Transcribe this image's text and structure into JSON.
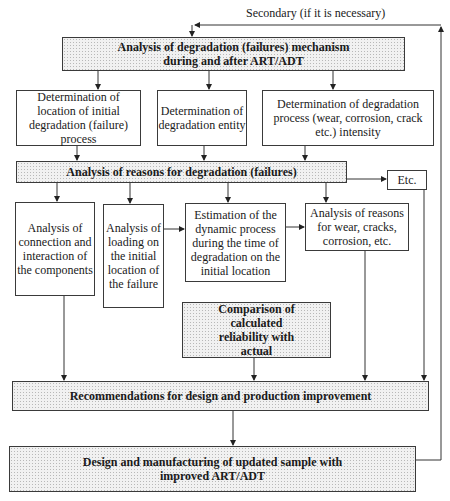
{
  "feedback_label": "Secondary (if it is necessary)",
  "nodes": {
    "mechanism": "Analysis of degradation (failures) mechanism during and after ART/ADT",
    "location": "Determination of location of initial degradation (failure) process",
    "entity": "Determination of degradation entity",
    "intensity": "Determination of degradation process (wear, corrosion, crack etc.) intensity",
    "reasons": "Analysis of reasons for degradation (failures)",
    "etc": "Etc.",
    "connection": "Analysis of connection and interaction of the components",
    "loading": "Analysis of loading on the initial location of the failure",
    "dynamic": "Estimation of the dynamic process during the time of degradation on the initial location",
    "wear_reasons": "Analysis of reasons for wear, cracks, corrosion, etc.",
    "comparison": "Comparison of calculated reliability with actual",
    "recommendations": "Recommendations for design and production improvement",
    "design": "Design and manufacturing of updated sample with improved ART/ADT"
  },
  "edges": [
    [
      "mechanism",
      "location"
    ],
    [
      "mechanism",
      "entity"
    ],
    [
      "mechanism",
      "intensity"
    ],
    [
      "location",
      "reasons"
    ],
    [
      "entity",
      "reasons"
    ],
    [
      "intensity",
      "reasons"
    ],
    [
      "reasons",
      "etc"
    ],
    [
      "reasons",
      "connection"
    ],
    [
      "reasons",
      "loading"
    ],
    [
      "reasons",
      "dynamic"
    ],
    [
      "reasons",
      "wear_reasons"
    ],
    [
      "loading",
      "dynamic"
    ],
    [
      "dynamic",
      "wear_reasons"
    ],
    [
      "connection",
      "recommendations"
    ],
    [
      "comparison",
      "recommendations"
    ],
    [
      "wear_reasons",
      "recommendations"
    ],
    [
      "etc",
      "recommendations"
    ],
    [
      "recommendations",
      "design"
    ],
    [
      "design",
      "mechanism"
    ]
  ]
}
